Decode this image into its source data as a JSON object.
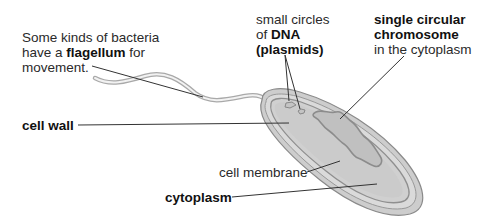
{
  "diagram": {
    "labels": {
      "flagellum_note": {
        "line1": "Some kinds of bacteria",
        "line2_pre": "have a ",
        "line2_bold": "flagellum",
        "line2_post": " for",
        "line3": "movement."
      },
      "plasmids": {
        "line1": "small circles",
        "line2_pre": "of ",
        "line2_bold": "DNA",
        "line3_bold": "(plasmids)"
      },
      "chromosome": {
        "line1_bold": "single circular",
        "line2_bold": "chromosome",
        "line3": "in the cytoplasm"
      },
      "cell_wall": "cell wall",
      "cell_membrane": "cell membrane",
      "cytoplasm": "cytoplasm"
    },
    "colors": {
      "wall_outer": "#c8c8c8",
      "wall_stroke": "#8a8a8a",
      "membrane": "#9a9a9a",
      "cytoplasm": "#cfcfcf",
      "chromosome_fill": "#c2c2c2",
      "chromosome_stroke": "#8c8c8c",
      "leader_line": "#333333"
    }
  }
}
